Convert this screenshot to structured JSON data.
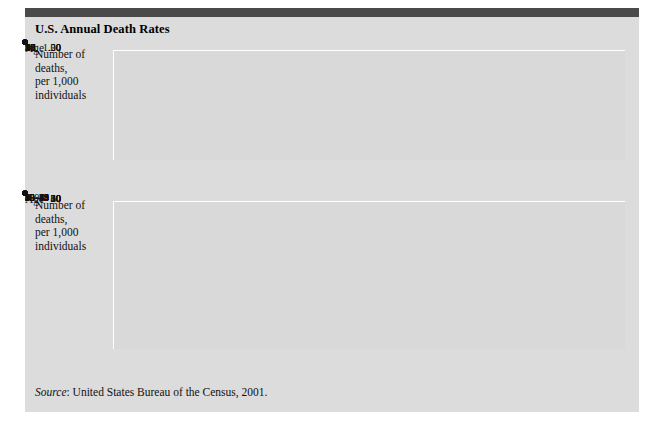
{
  "figure": {
    "title": "U.S. Annual Death Rates",
    "source_prefix": "Source",
    "source_text": ": United States Bureau of the Census, 2001.",
    "accent_bar_color": "#4a4a4a",
    "panel_color": "#dcdcdc",
    "plot_color": "#d9d9d9",
    "grid_color": "#ffffff",
    "line_color": "#3f3f3f",
    "marker_color": "#111111"
  },
  "chart_data": [
    {
      "type": "line",
      "id": "child-death-rates",
      "title": "U.S. Annual Death Rates",
      "xlabel": "Age",
      "ylabel": "Number of\ndeaths,\nper 1,000\nindividuals",
      "categories": [
        "1",
        "2",
        "3",
        "4",
        "5",
        "6",
        "7",
        "8",
        "9",
        "10",
        "11",
        "12",
        "13",
        "14",
        "15",
        "16",
        "17",
        "18",
        "19"
      ],
      "x": [
        1,
        2,
        3,
        4,
        5,
        6,
        7,
        8,
        9,
        10,
        11,
        12,
        13,
        14,
        15,
        16,
        17,
        18,
        19
      ],
      "values": [
        0.57,
        0.37,
        0.26,
        0.21,
        0.2,
        0.195,
        0.19,
        0.185,
        0.175,
        0.165,
        0.17,
        0.2,
        0.27,
        0.37,
        0.5,
        0.62,
        0.72,
        0.8,
        0.86
      ],
      "ytick_labels": [
        "1.00",
        ".50",
        ".20",
        "0"
      ],
      "ytick_values": [
        1.0,
        0.5,
        0.2,
        0.0
      ],
      "ytick_positions_pct": [
        0,
        48,
        78,
        100
      ],
      "ylim": [
        0,
        1.0
      ],
      "grid": true,
      "legend": "none"
    },
    {
      "type": "line",
      "id": "adult-death-rates",
      "title": "U.S. Annual Death Rates",
      "xlabel": "Age",
      "ylabel": "Number of\ndeaths,\nper 1,000\nindividuals",
      "categories": [
        "5–9",
        "10–14",
        "15–19",
        "20–24",
        "25–29",
        "30–34",
        "35–39",
        "40–44",
        "45–49",
        "50–54",
        "55–59",
        "60–64",
        "65–69",
        "70–74",
        "75–79",
        "80"
      ],
      "values": [
        0.2,
        0.2,
        0.7,
        1.0,
        1.0,
        1.3,
        1.8,
        2.4,
        3.2,
        4.5,
        6.6,
        10.5,
        16.2,
        25.0,
        39.5,
        60.0
      ],
      "ytick_labels": [
        "60",
        "50",
        "40",
        "30",
        "20",
        "10",
        "0"
      ],
      "ytick_values": [
        60,
        50,
        40,
        30,
        20,
        10,
        0
      ],
      "ylim": [
        0,
        60
      ],
      "grid": true,
      "legend": "none"
    }
  ]
}
